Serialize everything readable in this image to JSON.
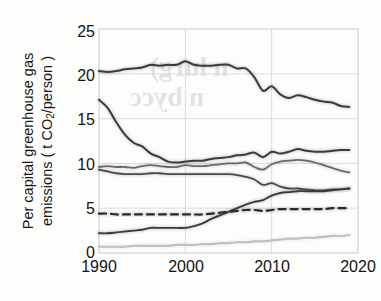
{
  "figure": {
    "kind": "scanned-line-chart",
    "background_color": "#fdfdfc",
    "ink_color": "#3a3a3a",
    "bleed_through_text": {
      "line1": "n lurg)",
      "line2": "n bycc"
    }
  },
  "axes": {
    "y_label_line1": "Per capital greenhouse gas",
    "y_label_line2_pre": "emissions ( t CO",
    "y_label_line2_sub": "2",
    "y_label_line2_post": "/person )",
    "y_ticks": [
      "0",
      "5",
      "10",
      "15",
      "20",
      "25"
    ],
    "x_ticks": [
      "1990",
      "2000",
      "2010",
      "2020"
    ]
  },
  "chart_data": {
    "type": "line",
    "title": "",
    "xlabel": "",
    "ylabel": "Per capital greenhouse gas emissions (t CO2/person)",
    "xlim": [
      1990,
      2020
    ],
    "ylim": [
      0,
      25
    ],
    "xticks": [
      1990,
      2000,
      2010,
      2020
    ],
    "yticks": [
      0,
      5,
      10,
      15,
      20,
      25
    ],
    "grid": true,
    "grid_color": "#dcdcdc",
    "legend": "none",
    "x": [
      1990,
      1991,
      1992,
      1993,
      1994,
      1995,
      1996,
      1997,
      1998,
      1999,
      2000,
      2001,
      2002,
      2003,
      2004,
      2005,
      2006,
      2007,
      2008,
      2009,
      2010,
      2011,
      2012,
      2013,
      2014,
      2015,
      2016,
      2017,
      2018,
      2019
    ],
    "series": [
      {
        "name": "series-top",
        "style": "solid",
        "color": "#3b3b3b",
        "width": 2.0,
        "values": [
          20.3,
          20.2,
          20.3,
          20.5,
          20.6,
          20.7,
          21.0,
          20.9,
          21.0,
          21.0,
          21.4,
          21.0,
          20.9,
          20.9,
          21.0,
          21.0,
          20.6,
          20.6,
          19.6,
          18.1,
          18.6,
          17.7,
          17.3,
          17.6,
          17.4,
          17.1,
          16.9,
          16.8,
          16.4,
          16.3
        ]
      },
      {
        "name": "series-steep-decline",
        "style": "solid",
        "color": "#3b3b3b",
        "width": 2.0,
        "values": [
          17.1,
          16.2,
          14.6,
          13.2,
          12.3,
          11.9,
          11.1,
          10.7,
          10.2,
          10.1,
          10.2,
          10.3,
          10.3,
          10.5,
          10.6,
          10.7,
          10.9,
          11.0,
          11.2,
          10.7,
          11.3,
          11.1,
          11.3,
          11.6,
          11.4,
          11.3,
          11.3,
          11.4,
          11.5,
          11.5
        ]
      },
      {
        "name": "series-upper-mid",
        "style": "solid",
        "color": "#6a6a6a",
        "width": 1.8,
        "values": [
          9.6,
          9.7,
          9.6,
          9.6,
          9.5,
          9.7,
          9.8,
          9.7,
          9.6,
          9.6,
          9.8,
          9.7,
          9.7,
          9.8,
          9.9,
          10.0,
          10.0,
          10.1,
          9.6,
          9.3,
          9.9,
          10.2,
          10.3,
          10.4,
          10.3,
          10.1,
          9.8,
          9.5,
          9.2,
          9.0
        ]
      },
      {
        "name": "series-lower-mid",
        "style": "solid",
        "color": "#4a4a4a",
        "width": 1.8,
        "values": [
          9.3,
          9.1,
          8.9,
          8.8,
          8.8,
          8.8,
          8.9,
          8.9,
          8.8,
          8.8,
          8.8,
          8.8,
          8.8,
          8.8,
          8.8,
          8.8,
          8.7,
          8.5,
          8.2,
          7.6,
          7.8,
          7.4,
          7.2,
          7.2,
          7.1,
          7.0,
          7.0,
          7.1,
          7.1,
          7.2
        ]
      },
      {
        "name": "series-rising",
        "style": "solid",
        "color": "#3b3b3b",
        "width": 1.9,
        "values": [
          2.2,
          2.2,
          2.3,
          2.4,
          2.5,
          2.6,
          2.8,
          2.8,
          2.8,
          2.8,
          2.8,
          3.0,
          3.3,
          3.8,
          4.2,
          4.6,
          5.0,
          5.4,
          5.7,
          5.9,
          6.4,
          6.7,
          6.8,
          6.9,
          6.9,
          6.9,
          6.9,
          7.0,
          7.1,
          7.2
        ]
      },
      {
        "name": "series-world-average",
        "style": "dashed",
        "color": "#2a2a2a",
        "width": 2.2,
        "values": [
          4.4,
          4.4,
          4.3,
          4.3,
          4.3,
          4.3,
          4.3,
          4.3,
          4.3,
          4.3,
          4.3,
          4.3,
          4.3,
          4.4,
          4.5,
          4.6,
          4.7,
          4.8,
          4.8,
          4.7,
          4.8,
          4.9,
          4.9,
          4.9,
          4.9,
          4.9,
          4.9,
          5.0,
          5.0,
          5.0
        ]
      },
      {
        "name": "series-bottom-faint",
        "style": "solid",
        "color": "#c0c0c0",
        "width": 2.2,
        "values": [
          0.7,
          0.7,
          0.7,
          0.7,
          0.8,
          0.8,
          0.8,
          0.8,
          0.8,
          0.9,
          0.9,
          0.9,
          1.0,
          1.0,
          1.1,
          1.1,
          1.2,
          1.2,
          1.3,
          1.3,
          1.4,
          1.5,
          1.6,
          1.6,
          1.7,
          1.7,
          1.8,
          1.9,
          1.9,
          2.0
        ]
      }
    ]
  }
}
